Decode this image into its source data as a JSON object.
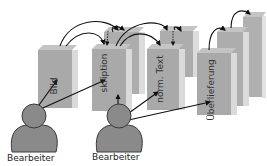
{
  "diagram": {
    "type": "layered-stages-with-actors",
    "colors": {
      "box_front": "#a9a9a9",
      "box_side": "#d9d9d9",
      "box_top": "#bdbdbd",
      "person_fill": "#8a8a8a",
      "person_stroke": "#3a3a3a",
      "arrow": "#111111"
    },
    "stages": [
      {
        "id": "bild",
        "label": "Bild"
      },
      {
        "id": "transkription",
        "label": "skription"
      },
      {
        "id": "norm-text",
        "label": "norm. Text"
      },
      {
        "id": "ueberlieferung",
        "label": "Überlieferung"
      }
    ],
    "actors": [
      {
        "id": "bearbeiter-1",
        "label": "Bearbeiter"
      },
      {
        "id": "bearbeiter-2",
        "label": "Bearbeiter"
      }
    ]
  }
}
